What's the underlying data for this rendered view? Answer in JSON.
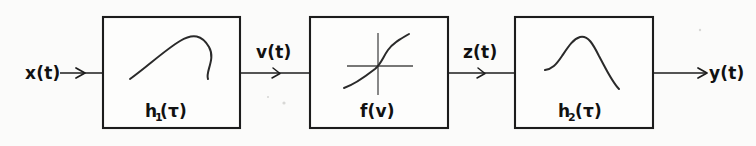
{
  "diagram": {
    "background_color": "#fbfbfa",
    "ink_color": "#1c1c1c",
    "blocks": [
      {
        "id": "block-h1",
        "label": "h",
        "subscript": "1",
        "label_tail": "(τ)",
        "full_label": "h₁(τ)",
        "glyph": "impulse-response-curve",
        "description": "broad asymmetric hump impulse response"
      },
      {
        "id": "block-f",
        "label": "f(v)",
        "subscript": "",
        "label_tail": "",
        "full_label": "f(v)",
        "glyph": "sigmoid-nonlinearity-curve",
        "description": "S-shaped static nonlinearity on cross axes"
      },
      {
        "id": "block-h2",
        "label": "h",
        "subscript": "2",
        "label_tail": "(τ)",
        "full_label": "h₂(τ)",
        "glyph": "impulse-response-curve",
        "description": "narrow peaked impulse response"
      }
    ],
    "signals": [
      {
        "id": "signal-x",
        "label": "x(t)",
        "position": "input-left"
      },
      {
        "id": "signal-v",
        "label": "v(t)",
        "position": "between-block1-block2"
      },
      {
        "id": "signal-z",
        "label": "z(t)",
        "position": "between-block2-block3"
      },
      {
        "id": "signal-y",
        "label": "y(t)",
        "position": "output-right"
      }
    ]
  }
}
